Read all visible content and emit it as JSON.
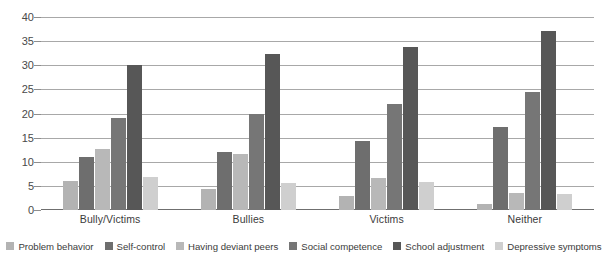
{
  "chart_data": {
    "type": "bar",
    "title": "",
    "xlabel": "",
    "ylabel": "",
    "ylim": [
      0,
      40
    ],
    "ytick_step": 5,
    "yticks": [
      "0",
      "5",
      "10",
      "15",
      "20",
      "25",
      "30",
      "35",
      "40"
    ],
    "grid": true,
    "legend_position": "bottom",
    "categories": [
      "Bully/Victims",
      "Bullies",
      "Victims",
      "Neither"
    ],
    "series": [
      {
        "name": "Problem behavior",
        "color": "#b3b3b3",
        "values": [
          6.0,
          4.3,
          3.0,
          1.2
        ]
      },
      {
        "name": "Self-control",
        "color": "#6e6e6e",
        "values": [
          11.0,
          12.0,
          14.3,
          17.3
        ]
      },
      {
        "name": "Having deviant peers",
        "color": "#b8b8b8",
        "values": [
          12.7,
          11.7,
          6.7,
          3.5
        ]
      },
      {
        "name": "Social competence",
        "color": "#767676",
        "values": [
          19.0,
          20.0,
          22.0,
          24.5
        ]
      },
      {
        "name": "School adjustment",
        "color": "#575757",
        "values": [
          30.0,
          32.3,
          33.7,
          37.0
        ]
      },
      {
        "name": "Depressive symptoms",
        "color": "#cfcfcf",
        "values": [
          6.8,
          5.5,
          5.8,
          3.3
        ]
      }
    ]
  },
  "colors": {
    "gridline": "#a8a8a8",
    "axis": "#6f6f6f",
    "text": "#3b3b3b",
    "background": "#ffffff"
  }
}
